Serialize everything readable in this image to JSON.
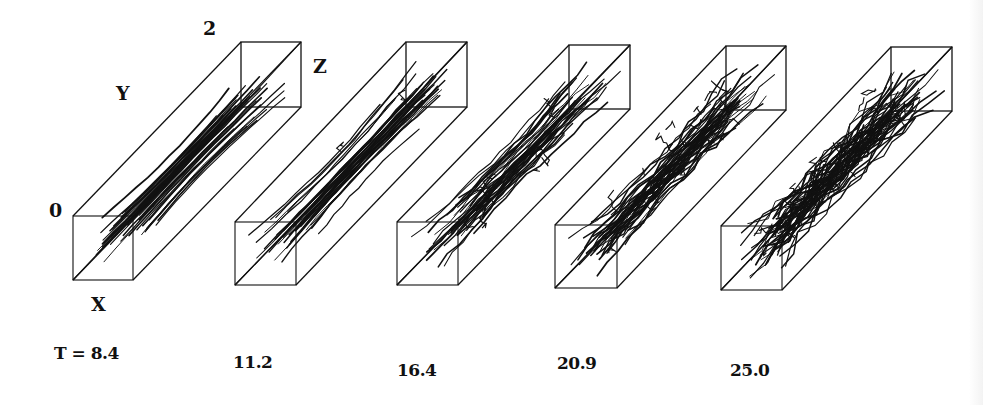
{
  "figure": {
    "axis_labels": {
      "origin": "0",
      "x": "X",
      "y": "Y",
      "top": "2",
      "z": "Z"
    },
    "panels": [
      {
        "time_label": "T = 8.4",
        "time": 8.4,
        "front": [
          73,
          216,
          133,
          280
        ],
        "back": [
          241,
          42,
          301,
          107
        ],
        "disorder": 0.05,
        "fibers": 34,
        "branches": 0
      },
      {
        "time_label": "11.2",
        "time": 11.2,
        "front": [
          235,
          222,
          296,
          285
        ],
        "back": [
          406,
          42,
          467,
          107
        ],
        "disorder": 0.12,
        "fibers": 34,
        "branches": 2
      },
      {
        "time_label": "16.4",
        "time": 16.4,
        "front": [
          397,
          222,
          458,
          285
        ],
        "back": [
          569,
          45,
          630,
          109
        ],
        "disorder": 0.3,
        "fibers": 36,
        "branches": 10
      },
      {
        "time_label": "20.9",
        "time": 20.9,
        "front": [
          555,
          225,
          617,
          288
        ],
        "back": [
          726,
          46,
          786,
          110
        ],
        "disorder": 0.55,
        "fibers": 44,
        "branches": 24
      },
      {
        "time_label": "25.0",
        "time": 25.0,
        "front": [
          721,
          226,
          782,
          290
        ],
        "back": [
          891,
          47,
          952,
          111
        ],
        "disorder": 0.85,
        "fibers": 54,
        "branches": 40
      }
    ],
    "colors": {
      "ink": "#111111",
      "background": "#ffffff"
    }
  }
}
